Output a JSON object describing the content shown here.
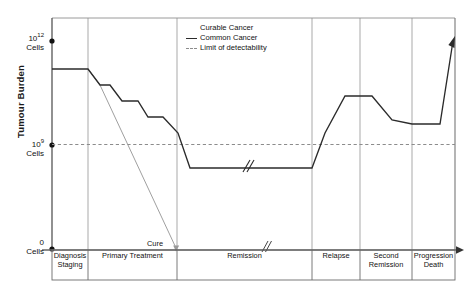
{
  "chart_data": {
    "type": "line",
    "title": "",
    "xlabel": "",
    "ylabel": "Tumour Burden",
    "y_ticks": [
      {
        "value": "10^12",
        "base": "10",
        "exp": "12",
        "unit": "Cells",
        "y_px": 41
      },
      {
        "value": "10^9",
        "base": "10",
        "exp": "9",
        "unit": "Cells",
        "y_px": 146
      },
      {
        "value": "0",
        "base": "0",
        "exp": "",
        "unit": "Cells",
        "y_px": 249
      }
    ],
    "ylim_labels": [
      "0 Cells",
      "10^12 Cells"
    ],
    "grid": "vertical phase separators only",
    "legend_position": "top-center",
    "annotations": [
      {
        "text": "Cure",
        "x_px": 147,
        "y_px": 239
      },
      {
        "text": "axis-break",
        "x_px": 265,
        "y_px": 247
      },
      {
        "text": "curve-break",
        "x_px": 247,
        "y_px": 168
      }
    ],
    "phases": [
      {
        "label": "Diagnosis\nStaging",
        "x_start_px": 52,
        "x_end_px": 88
      },
      {
        "label": "Primary Treatment",
        "x_start_px": 88,
        "x_end_px": 177
      },
      {
        "label": "Remission",
        "x_start_px": 177,
        "x_end_px": 312
      },
      {
        "label": "Relapse",
        "x_start_px": 312,
        "x_end_px": 360
      },
      {
        "label": "Second\nRemission",
        "x_start_px": 360,
        "x_end_px": 412
      },
      {
        "label": "Progression\nDeath",
        "x_start_px": 412,
        "x_end_px": 455
      }
    ],
    "series": [
      {
        "name": "Curable Cancer",
        "color": "#9a9a9a",
        "style": "solid-thin",
        "points_px": [
          [
            88,
            69
          ],
          [
            100,
            85
          ],
          [
            177,
            250
          ]
        ],
        "description": "Falls steeply and continuously from diagnosis to zero tumour burden at Cure"
      },
      {
        "name": "Common Cancer",
        "color": "#2b2b2b",
        "style": "solid",
        "points_px": [
          [
            52,
            69
          ],
          [
            88,
            69
          ],
          [
            100,
            85
          ],
          [
            110,
            85
          ],
          [
            122,
            101
          ],
          [
            138,
            101
          ],
          [
            148,
            117
          ],
          [
            163,
            117
          ],
          [
            178,
            133
          ],
          [
            190,
            168
          ],
          [
            312,
            168
          ],
          [
            325,
            133
          ],
          [
            345,
            96
          ],
          [
            372,
            96
          ],
          [
            392,
            120
          ],
          [
            412,
            124
          ],
          [
            440,
            124
          ],
          [
            455,
            40
          ]
        ],
        "description": "Stepwise log-kill decline through primary treatment, plateau below detectability in remission, sharp rise at relapse, partial response in second remission, then terminal progression"
      },
      {
        "name": "Limit of detectability",
        "color": "#8c8c8c",
        "style": "dashed",
        "y_px": 144,
        "description": "Horizontal dashed threshold at approximately 10^9 cells"
      }
    ]
  },
  "yaxis": {
    "title": "Tumour Burden",
    "top_label_base": "10",
    "top_label_exp": "12",
    "top_label_unit": "Cells",
    "mid_label_base": "10",
    "mid_label_exp": "9",
    "mid_label_unit": "Cells",
    "zero_label": "0",
    "zero_label_unit": "Cells"
  },
  "legend": {
    "items": [
      {
        "label": "Curable Cancer"
      },
      {
        "label": "Common Cancer"
      },
      {
        "label": "Limit of detectability"
      }
    ]
  },
  "phases": {
    "items": [
      {
        "line1": "Diagnosis",
        "line2": "Staging"
      },
      {
        "line1": "Primary Treatment",
        "line2": ""
      },
      {
        "line1": "Remission",
        "line2": ""
      },
      {
        "line1": "Relapse",
        "line2": ""
      },
      {
        "line1": "Second",
        "line2": "Remission"
      },
      {
        "line1": "Progression",
        "line2": "Death"
      }
    ]
  },
  "annotations": {
    "cure": "Cure"
  },
  "colors": {
    "common_cancer": "#2b2b2b",
    "curable_cancer": "#9a9a9a",
    "detectability": "#8c8c8c",
    "axis": "#555555",
    "gridline": "#9f9f9f",
    "background": "#ffffff"
  }
}
